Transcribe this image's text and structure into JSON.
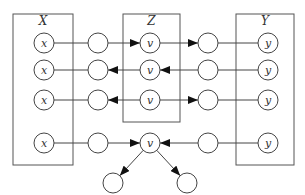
{
  "diagram": {
    "boxes": [
      {
        "id": "X",
        "label": "X",
        "x": 13,
        "y": 14,
        "w": 60,
        "h": 151
      },
      {
        "id": "Z",
        "label": "Z",
        "x": 123,
        "y": 14,
        "w": 57,
        "h": 108
      },
      {
        "id": "Y",
        "label": "Y",
        "x": 236,
        "y": 14,
        "w": 58,
        "h": 151
      }
    ],
    "rows": [
      {
        "name": "chain-forward",
        "y": 43,
        "x_label": "x",
        "v_label": "v",
        "y_label": "y",
        "left_arrow": "into-v",
        "right_arrow": "into-right-circle"
      },
      {
        "name": "chain-backward",
        "y": 70,
        "x_label": "x",
        "v_label": "v",
        "y_label": "y",
        "left_arrow": "into-left-circle",
        "right_arrow": "into-v"
      },
      {
        "name": "fork",
        "y": 100,
        "x_label": "x",
        "v_label": "v",
        "y_label": "y",
        "left_arrow": "into-left-circle",
        "right_arrow": "into-right-circle"
      },
      {
        "name": "collider",
        "y": 143,
        "x_label": "x",
        "v_label": "v",
        "y_label": "y",
        "left_arrow": "into-v",
        "right_arrow": "into-v"
      }
    ],
    "collider_descendants": [
      {
        "cx": 113,
        "cy": 183
      },
      {
        "cx": 187,
        "cy": 183
      }
    ],
    "columns": {
      "x_node": 44,
      "left_mid": 98,
      "v_node": 150,
      "right_mid": 208,
      "y_node": 268
    },
    "node_radius": 10
  }
}
